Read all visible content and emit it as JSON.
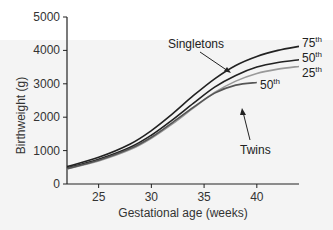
{
  "chart_data": {
    "type": "line",
    "title": "",
    "xlabel": "Gestational age (weeks)",
    "ylabel": "Birthweight (g)",
    "xlim": [
      22,
      44
    ],
    "ylim": [
      0,
      5000
    ],
    "xticks": [
      25,
      30,
      35,
      40
    ],
    "yticks": [
      0,
      1000,
      2000,
      3000,
      4000,
      5000
    ],
    "grid": false,
    "legend": "inline annotations",
    "x": [
      22,
      25,
      28,
      30,
      32,
      34,
      36,
      38,
      40,
      42,
      44
    ],
    "series": [
      {
        "name": "Singletons 75th",
        "group": "Singletons",
        "color": "#222222",
        "values": [
          520,
          800,
          1200,
          1600,
          2100,
          2650,
          3150,
          3550,
          3820,
          4000,
          4120
        ]
      },
      {
        "name": "Singletons 50th",
        "group": "Singletons",
        "color": "#222222",
        "values": [
          480,
          740,
          1100,
          1460,
          1920,
          2420,
          2900,
          3250,
          3500,
          3640,
          3720
        ]
      },
      {
        "name": "Singletons 25th",
        "group": "Singletons",
        "color": "#999999",
        "values": [
          450,
          690,
          1030,
          1370,
          1800,
          2280,
          2740,
          3080,
          3310,
          3440,
          3520
        ]
      },
      {
        "name": "Twins 50th",
        "group": "Twins",
        "color": "#555555",
        "values": [
          460,
          710,
          1060,
          1400,
          1840,
          2300,
          2720,
          2960,
          3040,
          null,
          null
        ]
      }
    ],
    "annotations": [
      {
        "text": "Singletons",
        "arrow_to": "Singletons 75th"
      },
      {
        "text": "Twins",
        "arrow_to": "Twins 50th"
      },
      {
        "text": "75th",
        "series": "Singletons 75th"
      },
      {
        "text": "50th",
        "series": "Singletons 50th"
      },
      {
        "text": "25th",
        "series": "Singletons 25th"
      },
      {
        "text": "50th",
        "series": "Twins 50th"
      }
    ]
  },
  "labels": {
    "singletons": "Singletons",
    "twins": "Twins",
    "p75": "75",
    "p50": "50",
    "p25": "25",
    "twins_p50": "50",
    "th": "th"
  }
}
